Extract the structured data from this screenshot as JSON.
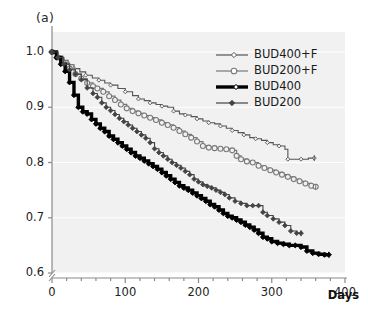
{
  "panel": {
    "label": "(a)"
  },
  "axes": {
    "x": {
      "title": "Days",
      "ticks": [
        0,
        100,
        200,
        300,
        400
      ],
      "tick_labels": [
        "0",
        "100",
        "200",
        "300",
        "400"
      ],
      "range": [
        0,
        400
      ],
      "minor_tick_step": 20
    },
    "y": {
      "title": "",
      "ticks": [
        0.6,
        0.7,
        0.8,
        0.9,
        1.0
      ],
      "tick_labels": [
        "0.6",
        "0.7",
        "0.8",
        "0.9",
        "1.0"
      ],
      "range": [
        0.58,
        1.02
      ],
      "axis_break": true
    }
  },
  "legend": {
    "position": "top-right",
    "entries": [
      {
        "label": "BUD400+F",
        "marker": "small-open-diamond",
        "color": "#555555",
        "linewidth": 1
      },
      {
        "label": "BUD200+F",
        "marker": "open-circle",
        "color": "#777777",
        "linewidth": 1.2
      },
      {
        "label": "BUD400",
        "marker": "thick-line",
        "color": "#000000",
        "linewidth": 3.2
      },
      {
        "label": "BUD200",
        "marker": "small-filled-dot",
        "color": "#444444",
        "linewidth": 1
      }
    ]
  },
  "colors": {
    "panel_background": "#f1f1f1",
    "gridline": "#ffffff",
    "axis": "#888888",
    "text": "#1a1a1a"
  },
  "chart_data": {
    "type": "line",
    "title": "",
    "subtitle": "",
    "xlabel": "Days",
    "ylabel": "",
    "xlim": [
      0,
      400
    ],
    "ylim": [
      0.58,
      1.02
    ],
    "grid": false,
    "legend_position": "top-right",
    "curve_style": "kaplan-meier-step",
    "series": [
      {
        "name": "BUD400+F",
        "marker": "small-open-diamond",
        "color": "#555555",
        "x": [
          0,
          8,
          15,
          22,
          30,
          38,
          46,
          55,
          64,
          72,
          80,
          90,
          100,
          110,
          118,
          126,
          134,
          142,
          150,
          158,
          166,
          174,
          182,
          190,
          198,
          206,
          214,
          222,
          230,
          238,
          246,
          254,
          262,
          270,
          278,
          286,
          294,
          302,
          310,
          318,
          322,
          330,
          340,
          350,
          358
        ],
        "y": [
          1.0,
          0.992,
          0.985,
          0.977,
          0.97,
          0.964,
          0.958,
          0.953,
          0.949,
          0.944,
          0.94,
          0.934,
          0.928,
          0.921,
          0.915,
          0.912,
          0.908,
          0.905,
          0.902,
          0.9,
          0.893,
          0.888,
          0.886,
          0.883,
          0.879,
          0.875,
          0.872,
          0.87,
          0.866,
          0.862,
          0.858,
          0.854,
          0.85,
          0.845,
          0.843,
          0.84,
          0.836,
          0.832,
          0.83,
          0.824,
          0.806,
          0.806,
          0.806,
          0.808,
          0.808
        ]
      },
      {
        "name": "BUD200+F",
        "marker": "open-circle",
        "color": "#777777",
        "x": [
          0,
          8,
          16,
          24,
          32,
          40,
          48,
          56,
          62,
          70,
          78,
          86,
          94,
          102,
          110,
          118,
          126,
          134,
          142,
          150,
          158,
          166,
          174,
          182,
          190,
          198,
          206,
          214,
          222,
          230,
          238,
          246,
          252,
          258,
          266,
          274,
          282,
          290,
          298,
          306,
          314,
          322,
          330,
          338,
          346,
          354,
          360
        ],
        "y": [
          1.0,
          0.99,
          0.98,
          0.97,
          0.96,
          0.952,
          0.944,
          0.938,
          0.934,
          0.928,
          0.92,
          0.913,
          0.905,
          0.898,
          0.893,
          0.889,
          0.885,
          0.881,
          0.877,
          0.872,
          0.868,
          0.863,
          0.857,
          0.851,
          0.845,
          0.838,
          0.83,
          0.827,
          0.826,
          0.825,
          0.824,
          0.822,
          0.812,
          0.806,
          0.802,
          0.8,
          0.794,
          0.79,
          0.786,
          0.782,
          0.778,
          0.774,
          0.77,
          0.766,
          0.762,
          0.758,
          0.756
        ]
      },
      {
        "name": "BUD400",
        "marker": "thick-line",
        "color": "#000000",
        "x": [
          0,
          6,
          12,
          18,
          24,
          30,
          36,
          42,
          48,
          54,
          60,
          66,
          72,
          78,
          84,
          90,
          96,
          102,
          108,
          114,
          120,
          126,
          132,
          138,
          144,
          150,
          156,
          162,
          168,
          174,
          180,
          186,
          192,
          198,
          204,
          210,
          216,
          222,
          228,
          234,
          240,
          246,
          252,
          258,
          264,
          270,
          276,
          282,
          288,
          294,
          300,
          308,
          316,
          324,
          332,
          340,
          348,
          356,
          364,
          372,
          378
        ],
        "y": [
          1.0,
          0.99,
          0.978,
          0.965,
          0.945,
          0.922,
          0.9,
          0.892,
          0.888,
          0.878,
          0.87,
          0.862,
          0.856,
          0.848,
          0.842,
          0.836,
          0.83,
          0.824,
          0.818,
          0.812,
          0.808,
          0.803,
          0.798,
          0.793,
          0.788,
          0.782,
          0.776,
          0.77,
          0.764,
          0.758,
          0.754,
          0.75,
          0.745,
          0.74,
          0.735,
          0.73,
          0.724,
          0.72,
          0.714,
          0.708,
          0.703,
          0.7,
          0.696,
          0.692,
          0.687,
          0.683,
          0.678,
          0.672,
          0.665,
          0.662,
          0.657,
          0.654,
          0.652,
          0.65,
          0.65,
          0.647,
          0.64,
          0.636,
          0.634,
          0.633,
          0.633
        ]
      },
      {
        "name": "BUD200",
        "marker": "small-filled-dot",
        "color": "#444444",
        "x": [
          0,
          8,
          16,
          24,
          32,
          40,
          48,
          56,
          62,
          68,
          74,
          80,
          86,
          92,
          98,
          104,
          110,
          116,
          122,
          128,
          134,
          140,
          146,
          152,
          158,
          164,
          170,
          176,
          182,
          188,
          194,
          200,
          206,
          212,
          218,
          224,
          230,
          236,
          242,
          250,
          258,
          266,
          274,
          282,
          288,
          294,
          302,
          310,
          318,
          326,
          334,
          340
        ],
        "y": [
          1.0,
          0.99,
          0.978,
          0.968,
          0.96,
          0.95,
          0.935,
          0.925,
          0.918,
          0.908,
          0.9,
          0.894,
          0.887,
          0.88,
          0.874,
          0.868,
          0.862,
          0.856,
          0.85,
          0.844,
          0.836,
          0.825,
          0.818,
          0.812,
          0.806,
          0.8,
          0.795,
          0.79,
          0.784,
          0.778,
          0.77,
          0.765,
          0.76,
          0.757,
          0.754,
          0.75,
          0.746,
          0.742,
          0.736,
          0.73,
          0.726,
          0.722,
          0.722,
          0.722,
          0.71,
          0.704,
          0.698,
          0.692,
          0.686,
          0.676,
          0.672,
          0.672
        ]
      }
    ]
  }
}
